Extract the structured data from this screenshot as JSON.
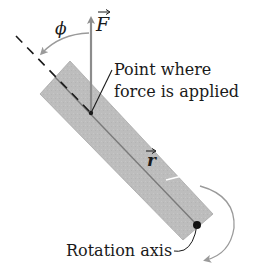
{
  "diagram": {
    "type": "torque-diagram",
    "labels": {
      "phi": "ϕ",
      "force": "F",
      "point_line1": "Point where",
      "point_line2": "force is applied",
      "r_vector": "r",
      "rotation_axis": "Rotation axis"
    },
    "colors": {
      "bar_fill": "#bdbdbd",
      "bar_edge": "#9e9e9e",
      "centerline": "#7a7a7a",
      "force_arrow": "#8c8c8c",
      "dashed_line": "#1a1a1a",
      "angle_arc": "#9a9a9a",
      "rotation_arc": "#9a9a9a",
      "text": "#1a1a1a"
    }
  }
}
